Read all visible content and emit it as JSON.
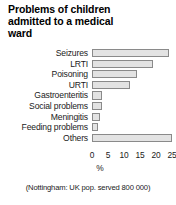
{
  "chart_data": {
    "type": "bar",
    "orientation": "horizontal",
    "title": "Problems of children admitted to a medical ward",
    "categories": [
      "Seizures",
      "LRTI",
      "Poisoning",
      "URTI",
      "Gastroenteritis",
      "Social problems",
      "Meningitis",
      "Feeding problems",
      "Others"
    ],
    "values": [
      24,
      19,
      14,
      12,
      3,
      3,
      2.5,
      2,
      25
    ],
    "xlabel": "%",
    "ylabel": "",
    "xlim": [
      0,
      25
    ],
    "ticks": [
      "0",
      "5",
      "10",
      "15",
      "20",
      "25"
    ],
    "tick_values": [
      0,
      5,
      10,
      15,
      20,
      25
    ],
    "grid": false,
    "legend": false,
    "caption": "(Nottingham: UK pop. served 800 000)",
    "bar_fill_color": "#e3e3e3",
    "bar_border_color": "#8a8a8a"
  }
}
